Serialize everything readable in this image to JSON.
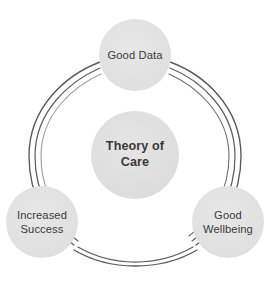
{
  "diagram": {
    "type": "cycle-ring",
    "colors": {
      "background": "#ffffff",
      "node_fill": "#e3e3e3",
      "node_fill_center": "#e1e1e1",
      "text": "#3a3a3a",
      "ring_stroke": "#4a4a4a"
    },
    "ring": {
      "center_x": 135,
      "center_y": 155,
      "radius": 106,
      "stroke_count": 3,
      "style": "hand-drawn"
    },
    "center_node": {
      "id": "theory-of-care",
      "label": "Theory of\nCare",
      "radius": 44,
      "cx": 135,
      "cy": 155,
      "bold": true
    },
    "nodes": [
      {
        "id": "good-data",
        "label": "Good Data",
        "radius": 36,
        "cx": 135,
        "cy": 55,
        "position": "top"
      },
      {
        "id": "good-wellbeing",
        "label": "Good\nWellbeing",
        "radius": 36,
        "cx": 228,
        "cy": 222,
        "position": "bottom-right"
      },
      {
        "id": "increased-success",
        "label": "Increased\nSuccess",
        "radius": 36,
        "cx": 42,
        "cy": 222,
        "position": "bottom-left"
      }
    ]
  }
}
